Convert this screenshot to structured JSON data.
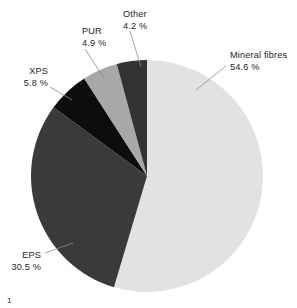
{
  "chart_data": {
    "type": "pie",
    "title": "",
    "subtitle": "",
    "xlabel": "",
    "ylabel": "",
    "legend_position": "none",
    "grid": false,
    "units": "%",
    "start_angle_deg": 0,
    "direction": "clockwise",
    "categories": [
      "Mineral fibres",
      "EPS",
      "XPS",
      "PUR",
      "Other"
    ],
    "values": [
      54.6,
      30.5,
      5.8,
      4.9,
      4.2
    ],
    "slices": [
      {
        "name": "Mineral fibres",
        "label": "Mineral fibres",
        "value": 54.6,
        "value_label": "54.6 %",
        "color": "#e2e2e2",
        "label_x": 230,
        "label_y": 58,
        "label_anchor": "start",
        "leader": "M 226 66 L 196 90"
      },
      {
        "name": "EPS",
        "label": "EPS",
        "value": 30.5,
        "value_label": "30.5 %",
        "color": "#3a3a3a",
        "label_x": 41,
        "label_y": 258,
        "label_anchor": "end",
        "leader": "M 45 253 L 73 243"
      },
      {
        "name": "XPS",
        "label": "XPS",
        "value": 5.8,
        "value_label": "5.8 %",
        "color": "#0d0d0d",
        "label_x": 48,
        "label_y": 74,
        "label_anchor": "end",
        "leader": "M 50 87 L 72 100"
      },
      {
        "name": "PUR",
        "label": "PUR",
        "value": 4.9,
        "value_label": "4.9 %",
        "color": "#a8a8a8",
        "label_x": 82,
        "label_y": 34,
        "label_anchor": "start",
        "leader": "M 85 49 L 104 78"
      },
      {
        "name": "Other",
        "label": "Other",
        "value": 4.2,
        "value_label": "4.2 %",
        "color": "#333333",
        "label_x": 123,
        "label_y": 17,
        "label_anchor": "start",
        "leader": "M 130 31 L 141 67"
      }
    ],
    "geometry": {
      "center_x": 147,
      "center_y": 176,
      "radius": 116
    }
  },
  "footnote": {
    "marker": "1"
  }
}
